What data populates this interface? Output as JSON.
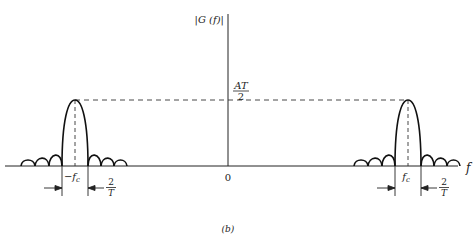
{
  "figure": {
    "caption": "(b)",
    "y_axis_label": "|G (f)|",
    "x_axis_label": "f",
    "origin_label": "0",
    "peak_label_numerator": "AT",
    "peak_label_denominator": "2",
    "left_carrier_label": "−f",
    "left_carrier_sub": "c",
    "right_carrier_label": "f",
    "right_carrier_sub": "c",
    "width_label_numerator": "2",
    "width_label_denominator": "T"
  },
  "spectrum": {
    "description": "Magnitude spectrum of RF pulse: sinc-shaped lobes centered at ±fc",
    "carriers": [
      "-fc",
      "fc"
    ],
    "peak_value": "AT/2",
    "main_lobe_width": "2/T",
    "sidelobe_relative_heights": [
      0.19,
      0.16,
      0.12
    ]
  }
}
